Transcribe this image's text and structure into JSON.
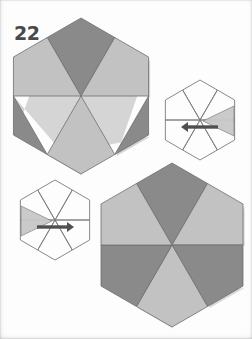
{
  "page": {
    "figure_number": "22",
    "background_color": "#fdfdfd",
    "width": 252,
    "height": 339
  },
  "palette": {
    "dark_gray": "#8a8a8a",
    "mid_dark_gray": "#828282",
    "light_gray": "#c2c2c2",
    "pale_gray": "#c8c8c8",
    "white": "#ffffff",
    "outline": "#6e6e6e",
    "wire_outline": "#7a7a7a",
    "arrow": "#4f4f4f",
    "label_color": "#4a4a4a",
    "shadow": "#b5b5b5"
  },
  "figures": [
    {
      "id": "star-top-left",
      "name": "partially-folded-star-upper-left",
      "type": "hexagram-rhombi",
      "state": "two-lower-rhombi-folded",
      "center": {
        "x": 81,
        "y": 96
      },
      "radius": 78,
      "rhombi": [
        {
          "position": "top",
          "angle": 270,
          "fill": "dark",
          "folded": false
        },
        {
          "position": "upper-right",
          "angle": 330,
          "fill": "light",
          "folded": false
        },
        {
          "position": "lower-right",
          "angle": 30,
          "fill": "dark",
          "folded": true
        },
        {
          "position": "bottom",
          "angle": 90,
          "fill": "light",
          "folded": false
        },
        {
          "position": "lower-left",
          "angle": 150,
          "fill": "dark",
          "folded": true
        },
        {
          "position": "upper-left",
          "angle": 210,
          "fill": "light",
          "folded": false
        }
      ]
    },
    {
      "id": "wire-star-right",
      "name": "wireframe-star-with-fold-arrow-right",
      "type": "hexagram-wireframe",
      "center": {
        "x": 200,
        "y": 120
      },
      "radius": 40,
      "arrow": {
        "direction": "left",
        "label": "fold-inward"
      },
      "flap": {
        "side": "right",
        "fill": "light"
      }
    },
    {
      "id": "wire-star-left",
      "name": "wireframe-star-with-fold-arrow-left",
      "type": "hexagram-wireframe",
      "center": {
        "x": 55,
        "y": 220
      },
      "radius": 40,
      "arrow": {
        "direction": "right",
        "label": "fold-inward"
      },
      "flap": {
        "side": "left",
        "fill": "light"
      }
    },
    {
      "id": "star-bottom-right",
      "name": "completed-star-lower-right",
      "type": "hexagram-rhombi",
      "state": "complete",
      "center": {
        "x": 172,
        "y": 245
      },
      "radius": 82,
      "rhombi": [
        {
          "position": "top",
          "angle": 270,
          "fill": "dark",
          "folded": false
        },
        {
          "position": "upper-right",
          "angle": 330,
          "fill": "light",
          "folded": false
        },
        {
          "position": "lower-right",
          "angle": 30,
          "fill": "dark",
          "folded": false
        },
        {
          "position": "bottom",
          "angle": 90,
          "fill": "light",
          "folded": false
        },
        {
          "position": "lower-left",
          "angle": 150,
          "fill": "dark",
          "folded": false
        },
        {
          "position": "upper-left",
          "angle": 210,
          "fill": "light",
          "folded": false
        }
      ]
    }
  ]
}
